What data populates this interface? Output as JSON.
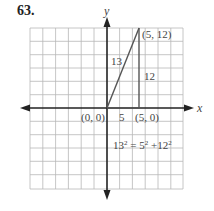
{
  "problem_number": "63.",
  "axes": {
    "x_label": "x",
    "y_label": "y"
  },
  "points": {
    "origin": "(0, 0)",
    "top": "(5, 12)",
    "base": "(5, 0)"
  },
  "side_labels": {
    "hypotenuse": "13",
    "vertical": "12",
    "horizontal": "5"
  },
  "equation": {
    "a": "13",
    "b": "5",
    "c": "12",
    "exp": "2"
  },
  "colors": {
    "grid": "#b8b8b8",
    "axis": "#222222",
    "triangle": "#555555"
  }
}
